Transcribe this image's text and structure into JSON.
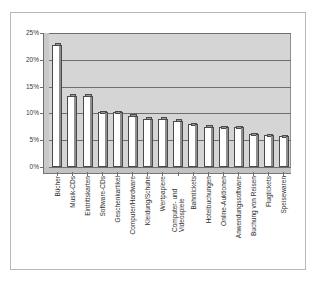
{
  "chart_data": {
    "type": "bar",
    "title": "",
    "subtitle": "",
    "xlabel": "",
    "ylabel": "",
    "ylim": [
      0,
      25
    ],
    "ytick_labels": [
      "25%",
      "20%",
      "15%",
      "10%",
      "5%",
      "0%"
    ],
    "ytick_values": [
      25,
      20,
      15,
      10,
      5,
      0
    ],
    "grid": true,
    "legend": "none",
    "orientation": "vertical",
    "style": "3d-column",
    "categories": [
      "Bücher",
      "Musik-CDs",
      "Eintrittskarten",
      "Software-CDs",
      "Geschenkartikel",
      "Computer/Hardware",
      "Kleidung/Schuhe",
      "Wertpapiere",
      "Computer- und Videospiele",
      "Bahntickets",
      "Hotelbuchungen",
      "Online-Auktionen",
      "Anwendungssoftware",
      "Buchung von Reisen",
      "Flugtickets",
      "Speisewaren"
    ],
    "values": [
      22.8,
      13.3,
      13.3,
      10.2,
      10.2,
      9.6,
      9.0,
      9.0,
      8.6,
      8.0,
      7.5,
      7.4,
      7.4,
      6.1,
      5.9,
      5.7
    ],
    "value_unit": "%"
  },
  "colors": {
    "bar_face": "#ffffff",
    "bar_edge": "#4a4a4a",
    "bar_top": "#9a9a9a",
    "bar_side": "#8e8e8e",
    "plot_background": "#d5d5d5",
    "gridline": "#6e6e6e",
    "figure_background": "#ffffff",
    "figure_border": "#b8b8b8",
    "text": "#2f2f2f"
  }
}
